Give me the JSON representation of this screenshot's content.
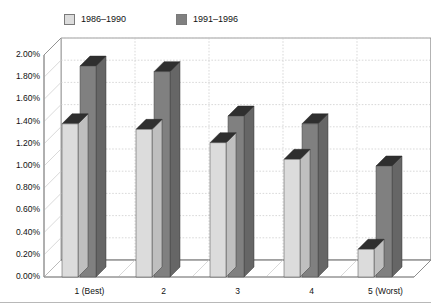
{
  "chart_data": {
    "type": "bar",
    "title": "",
    "subtitle": "",
    "xlabel": "",
    "ylabel": "",
    "categories": [
      "1 (Best)",
      "2",
      "3",
      "4",
      "5 (Worst)"
    ],
    "series": [
      {
        "name": "1986–1990",
        "color": "#DCDCDC",
        "values": [
          1.38,
          1.33,
          1.21,
          1.06,
          0.25
        ]
      },
      {
        "name": "1991–1996",
        "color": "#808080",
        "values": [
          1.9,
          1.85,
          1.45,
          1.38,
          1.0
        ]
      }
    ],
    "ylim": [
      0,
      2.0
    ],
    "ytick_step": 0.2,
    "ytick_labels": [
      "0.00%",
      "0.20%",
      "0.40%",
      "0.60%",
      "0.80%",
      "1.00%",
      "1.20%",
      "1.40%",
      "1.60%",
      "1.80%",
      "2.00%"
    ],
    "ytick_values": [
      0,
      0.2,
      0.4,
      0.6,
      0.8,
      1.0,
      1.2,
      1.4,
      1.6,
      1.8,
      2.0
    ],
    "value_format": "percent",
    "grid": true,
    "grid_axis": "y",
    "legend_position": "top-left",
    "style": "3d-column",
    "colors": {
      "series_light": "#DCDCDC",
      "series_light_side": "#BFBFBF",
      "series_light_top": "#2F2F2F",
      "series_dark": "#808080",
      "series_dark_side": "#666666",
      "series_dark_top": "#2F2F2F",
      "gridline": "#C8C8C8",
      "axis_line": "#888888",
      "floor": "#FFFFFF",
      "back_wall": "#FFFFFF",
      "text": "#111111"
    }
  },
  "legend": {
    "entries": [
      {
        "label": "1986–1990",
        "swatch": "#DCDCDC"
      },
      {
        "label": "1991–1996",
        "swatch": "#808080"
      }
    ]
  },
  "axes": {
    "y": {
      "ticks": [
        "2.00%",
        "1.80%",
        "1.60%",
        "1.40%",
        "1.20%",
        "1.00%",
        "0.80%",
        "0.60%",
        "0.40%",
        "0.20%",
        "0.00%"
      ]
    },
    "x": {
      "ticks": [
        "1 (Best)",
        "2",
        "3",
        "4",
        "5 (Worst)"
      ]
    }
  }
}
